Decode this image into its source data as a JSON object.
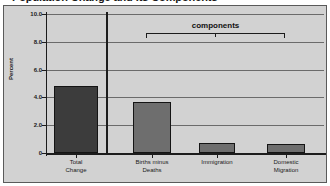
{
  "figure": {
    "title_cropped": "Population Change and Its Components",
    "background_color": "#d2d2d2",
    "frame_border_color": "#5a5a5a"
  },
  "annotation": {
    "bracket_label": "components"
  },
  "chart_data": {
    "type": "bar",
    "title": "",
    "xlabel": "",
    "ylabel": "Percent",
    "ylim": [
      0,
      10.0
    ],
    "grid": true,
    "legend": "none",
    "categories": [
      "Total\nChange",
      "Births minus\nDeaths",
      "Immigration",
      "Domestic\nMigration"
    ],
    "values": [
      4.8,
      3.7,
      0.7,
      0.65
    ],
    "bar_colors": [
      "#3c3c3c",
      "#6e6e6e",
      "#6e6e6e",
      "#6e6e6e"
    ],
    "ytick_labels": [
      "10.0",
      "8.0",
      "6.0",
      "4.0",
      "2.0",
      "0"
    ],
    "ytick_values": [
      10.0,
      8.0,
      6.0,
      4.0,
      2.0,
      0
    ]
  }
}
